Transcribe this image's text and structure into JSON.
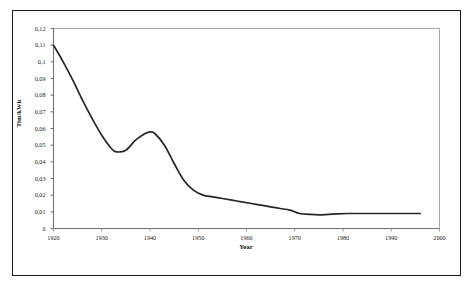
{
  "chart_data": {
    "type": "line",
    "title": "",
    "xlabel": "Year",
    "ylabel": "Tim/kWh",
    "xlim": [
      1920,
      2000
    ],
    "ylim": [
      0,
      0.12
    ],
    "grid": false,
    "legend": null,
    "decimal_separator": ",",
    "x_ticks": [
      "1920",
      "1930",
      "1940",
      "1950",
      "1960",
      "1970",
      "1980",
      "1990",
      "2000"
    ],
    "x_tick_values": [
      1920,
      1930,
      1940,
      1950,
      1960,
      1970,
      1980,
      1990,
      2000
    ],
    "y_ticks": [
      "0",
      "0,01",
      "0,02",
      "0,03",
      "0,04",
      "0,05",
      "0,06",
      "0,07",
      "0,08",
      "0,09",
      "0,1",
      "0,11",
      "0,12"
    ],
    "y_tick_values": [
      0,
      0.01,
      0.02,
      0.03,
      0.04,
      0.05,
      0.06,
      0.07,
      0.08,
      0.09,
      0.1,
      0.11,
      0.12
    ],
    "series": [
      {
        "name": "Tim/kWh",
        "color": "#262626",
        "x": [
          1920,
          1922,
          1924,
          1926,
          1928,
          1930,
          1932,
          1933,
          1935,
          1937,
          1939,
          1940,
          1941,
          1943,
          1945,
          1947,
          1949,
          1951,
          1953,
          1955,
          1957,
          1959,
          1961,
          1963,
          1965,
          1967,
          1969,
          1971,
          1973,
          1975,
          1977,
          1979,
          1981,
          1983,
          1985,
          1988,
          1991,
          1994,
          1996
        ],
        "values": [
          0.11,
          0.1,
          0.089,
          0.077,
          0.066,
          0.056,
          0.048,
          0.046,
          0.047,
          0.053,
          0.057,
          0.058,
          0.057,
          0.05,
          0.039,
          0.029,
          0.023,
          0.02,
          0.019,
          0.018,
          0.017,
          0.016,
          0.015,
          0.014,
          0.013,
          0.012,
          0.011,
          0.009,
          0.0085,
          0.0082,
          0.0085,
          0.0088,
          0.009,
          0.009,
          0.009,
          0.009,
          0.009,
          0.009,
          0.009
        ]
      }
    ],
    "annotations": {
      "start_value": 0.11,
      "local_minimum": {
        "x": 1933,
        "y": 0.046
      },
      "local_maximum": {
        "x": 1940,
        "y": 0.058
      },
      "global_minimum": {
        "x": 1975,
        "y": 0.0082
      },
      "end_value": 0.009
    }
  },
  "frame": {
    "outer_border_color": "#1a1a1a",
    "plot_frame_color": "#a8a8a8",
    "background": "#ffffff"
  }
}
